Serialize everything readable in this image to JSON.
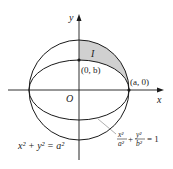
{
  "figure": {
    "colors": {
      "stroke": "#1a1a1a",
      "shade": "#d0d0d0",
      "leader": "#9a9a9a"
    },
    "axes": {
      "x_label": "x",
      "y_label": "y",
      "origin_label": "O"
    },
    "points": {
      "top_ellipse": "(0, b)",
      "right_vertex": "(a, 0)"
    },
    "region_label": "I",
    "circle_equation": {
      "lhs": "x² + y² = a²"
    },
    "ellipse_equation": {
      "x_num": "x²",
      "x_den": "a²",
      "plus": "+",
      "y_num": "y²",
      "y_den": "b²",
      "rhs": "= 1"
    },
    "geometry": {
      "center": [
        79,
        90
      ],
      "a": 50,
      "b": 30
    }
  }
}
